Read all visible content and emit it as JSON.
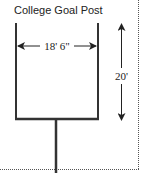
{
  "title": "College Goal Post",
  "dimensions": {
    "width_label": "18' 6\"",
    "height_label": "20'"
  },
  "colors": {
    "stroke": "#333333",
    "text": "#222222",
    "dotted": "#555555"
  }
}
